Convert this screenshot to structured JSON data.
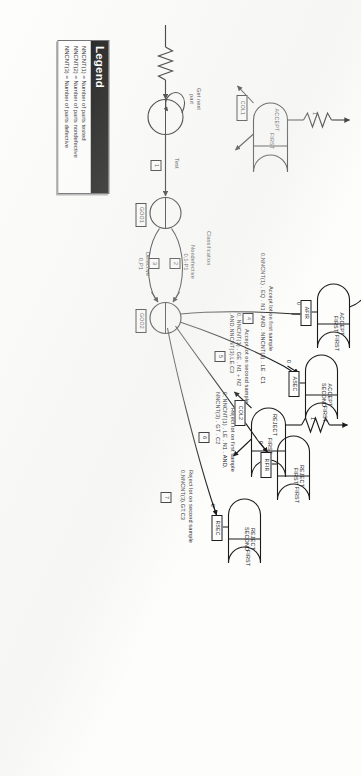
{
  "diagram": {
    "type": "slam-network",
    "source_nodes": [
      {
        "id": "get-next-part",
        "label": "Get next\npart",
        "kind": "create"
      }
    ],
    "activities": [
      {
        "num": "1",
        "label": "Test"
      },
      {
        "num": "2",
        "label": "Nondefective",
        "spec": "0,1-P1"
      },
      {
        "num": "3",
        "label": "Defective",
        "spec": "0,P1"
      },
      {
        "num": "4",
        "label": "Accept lot on first sample",
        "spec": "0,NNCNT(1) . EQ . N1 . AND . NNCNT(3) . LE . C1"
      },
      {
        "num": "5",
        "label": "Accept lot on second sample",
        "spec": "0, NNCNT(1) . GE . N1 + N2\n.AND.NNCNT(3).LE.C3"
      },
      {
        "num": "6",
        "label": "Reject lot on first sample",
        "spec": "0, NNCNT(1) . LE . N1 . AND.\nNNCNT(3) . GT . C2"
      },
      {
        "num": "7",
        "label": "Reject lot on second sample",
        "spec": "0,NNCNT(3).GT.C3"
      }
    ],
    "section_label": "Classification",
    "queue_nodes": [
      {
        "id": "goo1",
        "tag": "GOO1"
      },
      {
        "id": "goo2",
        "tag": "GOO2"
      }
    ],
    "assign_nodes": [
      {
        "id": "afir",
        "title": "ACCEPT\nFIRST",
        "gate": "FIRST",
        "tag": "AFIR"
      },
      {
        "id": "asec",
        "title": "ACCEPT\nSECOND",
        "gate": "FIRST",
        "tag": "ASEC"
      },
      {
        "id": "rfir",
        "title": "REJECT\nFIRST",
        "gate": "FIRST",
        "tag": "RFIR"
      },
      {
        "id": "rsec",
        "title": "REJECT\nSECOND",
        "gate": "FIRST",
        "tag": "RSEC"
      },
      {
        "id": "col1",
        "title": "ACCEPT",
        "gate": "FIRST",
        "tag": "COL1"
      },
      {
        "id": "col2",
        "title": "REJECT",
        "gate": "FIRST",
        "tag": "COL2"
      }
    ],
    "branch_marks": [
      "0",
      "0",
      "0",
      "0",
      "1",
      "1",
      "1"
    ]
  },
  "legend": {
    "title": "Legend",
    "rows": [
      "NNCNT(1) = Number of parts tested",
      "NNCNT(2) = Number of parts nondefective",
      "NNCNT(3) = Number of parts defective"
    ]
  }
}
